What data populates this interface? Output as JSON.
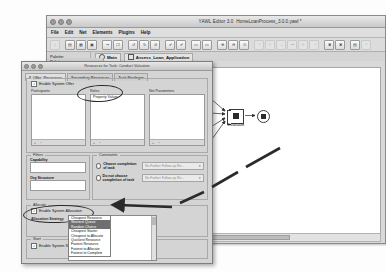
{
  "editor": {
    "title": "YAWL Editor 3.0",
    "file_title": "HomeLoanProcess_3.0.0.yawl *",
    "menus": [
      "File",
      "Edit",
      "Net",
      "Elements",
      "Plugins",
      "Help"
    ],
    "palette_label": "Palette:",
    "tabs": [
      {
        "label": "Main",
        "icon": "net-root-icon"
      },
      {
        "label": "Assess_Loan_Application",
        "icon": "net-sub-icon"
      }
    ],
    "toolbar_icons": [
      "new-file-icon",
      "open-file-icon",
      "save-icon",
      "save-as-icon",
      "save-all-icon",
      "cut-icon",
      "copy-icon",
      "paste-icon",
      "undo-icon",
      "redo-icon",
      "delete-icon",
      "validate-icon",
      "analyse-icon",
      "new-net-icon",
      "new-subnet-icon",
      "zoom-in-icon",
      "zoom-out-icon",
      "zoom-reset-icon",
      "align-top-icon",
      "align-middle-icon",
      "align-bottom-icon",
      "align-left-icon",
      "align-center-icon",
      "align-right-icon",
      "decompose-icon",
      "cancel-region-icon",
      "print-icon",
      "help-icon"
    ],
    "palette_tools": [
      "select-tool-icon",
      "marquee-tool-icon",
      "condition-tool-icon",
      "state-tool-icon",
      "atomic-task-icon",
      "composite-task-icon"
    ]
  },
  "diagram": {
    "nodes": [
      {
        "id": "start",
        "label": "",
        "type": "input-condition"
      },
      {
        "id": "prep",
        "label": "Make\nPreparation",
        "type": "atomic-task-split"
      },
      {
        "id": "income",
        "label": "Verify\nIncome",
        "type": "atomic-task"
      },
      {
        "id": "ident",
        "label": "Verify\nIdentity",
        "type": "atomic-task"
      },
      {
        "id": "credit",
        "label": "Credit Check",
        "type": "atomic-task"
      },
      {
        "id": "valu",
        "label": "Conduct\nValuation",
        "type": "multiple-instance-task"
      },
      {
        "id": "eval",
        "label": "Evaluate",
        "type": "atomic-task-join"
      },
      {
        "id": "end",
        "label": "",
        "type": "output-condition"
      }
    ],
    "edges": [
      [
        "start",
        "prep"
      ],
      [
        "prep",
        "income"
      ],
      [
        "prep",
        "ident"
      ],
      [
        "prep",
        "credit"
      ],
      [
        "prep",
        "valu"
      ],
      [
        "income",
        "eval"
      ],
      [
        "ident",
        "eval"
      ],
      [
        "credit",
        "eval"
      ],
      [
        "valu",
        "eval"
      ],
      [
        "eval",
        "end"
      ]
    ]
  },
  "dialog": {
    "caption": "Resources for Task: Conduct Valuation",
    "tabs": [
      "Primary Resources",
      "Secondary Resources",
      "Task Privileges"
    ],
    "offer": {
      "group_label": "Offer",
      "enable_label": "Enable System Offer",
      "enable_checked": true,
      "columns": [
        {
          "label": "Participants",
          "items": []
        },
        {
          "label": "Roles",
          "items": [
            "Property Valuer"
          ]
        },
        {
          "label": "Net Parameters",
          "items": []
        }
      ],
      "list_footer_icons": [
        "add-icon",
        "remove-icon"
      ]
    },
    "filters": {
      "group_label": "Filters",
      "fields": [
        {
          "label": "Capability",
          "value": ""
        },
        {
          "label": "Org Structure",
          "value": ""
        }
      ]
    },
    "constraints": {
      "group_label": "Constraints",
      "options": [
        {
          "label": "Choose completion of task",
          "selected": false,
          "combo": "No Further Follow-up Re..."
        },
        {
          "label": "Do not choose completion of task",
          "selected": false,
          "combo": "No Further Follow-up Re..."
        }
      ]
    },
    "allocate": {
      "group_label": "Allocate",
      "enable_label": "Enable System Allocation",
      "enable_checked": true,
      "strategy_label": "Allocation Strategy",
      "strategy_value": "Cheapest Resource",
      "options": [
        "Cheapest Resource",
        "Shortest Queue",
        "Random Choice",
        "Cheapest Starter",
        "Cheapest to Allocate",
        "Quickest Resource",
        "Fastest Resource",
        "Fastest to Allocate",
        "Fastest to Complete"
      ]
    },
    "start": {
      "group_label": "Start",
      "enable_label": "Enable System Start",
      "enable_checked": true
    }
  },
  "annotations": {
    "ellipse_roles": "highlight-roles-field",
    "ellipse_strategy": "highlight-allocation-strategy",
    "arrow": "arrow-from-conduct-valuation-to-dialog"
  },
  "colors": {
    "window_bg": "#d9d9d9",
    "dialog_bg": "#d4d4d4",
    "canvas_bg": "#ffffff",
    "ink": "#2b2b2b",
    "annotation": "#2a2a2a"
  }
}
